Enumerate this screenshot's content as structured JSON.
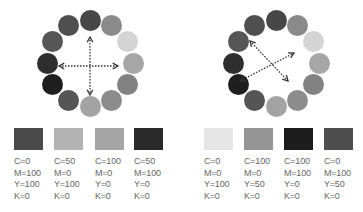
{
  "left_panel": {
    "wheel": {
      "colors": [
        "#474747",
        "#8a8a8a",
        "#d4d4d4",
        "#a6a6a6",
        "#828282",
        "#8c8c8c",
        "#a3a3a3",
        "#555555",
        "#1f1f1f",
        "#2e2e2e",
        "#565656",
        "#4f4f4f"
      ],
      "arrows": "vertical-horizontal"
    },
    "swatches": [
      {
        "color": "#4a4a4a",
        "c": "C=0",
        "m": "M=100",
        "y": "Y=100",
        "k": "K=0"
      },
      {
        "color": "#b3b3b3",
        "c": "C=50",
        "m": "M=0",
        "y": "Y=100",
        "k": "K=0"
      },
      {
        "color": "#a5a5a5",
        "c": "C=100",
        "m": "M=0",
        "y": "Y=0",
        "k": "K=0"
      },
      {
        "color": "#2a2a2a",
        "c": "C=50",
        "m": "M=100",
        "y": "Y=0",
        "k": "K=0"
      }
    ]
  },
  "right_panel": {
    "wheel": {
      "colors": [
        "#474747",
        "#8a8a8a",
        "#d4d4d4",
        "#a6a6a6",
        "#828282",
        "#8c8c8c",
        "#a3a3a3",
        "#555555",
        "#1f1f1f",
        "#2e2e2e",
        "#565656",
        "#4f4f4f"
      ],
      "arrows": "diagonal"
    },
    "swatches": [
      {
        "color": "#e6e6e6",
        "c": "C=0",
        "m": "M=0",
        "y": "Y=100",
        "k": "K=0"
      },
      {
        "color": "#959595",
        "c": "C=100",
        "m": "M=0",
        "y": "Y=50",
        "k": "K=0"
      },
      {
        "color": "#1c1c1c",
        "c": "C=100",
        "m": "M=100",
        "y": "Y=0",
        "k": "K=0"
      },
      {
        "color": "#4e4e4e",
        "c": "C=0",
        "m": "M=100",
        "y": "Y=50",
        "k": "K=0"
      }
    ]
  }
}
